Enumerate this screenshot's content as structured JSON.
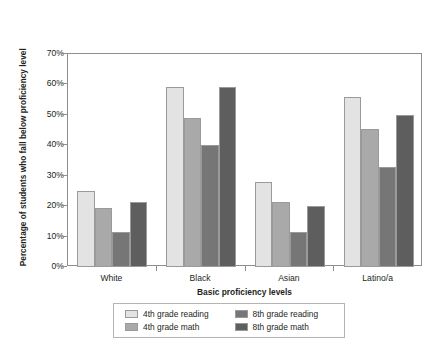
{
  "chart_data": {
    "type": "bar",
    "title": "",
    "xlabel": "Basic proficiency levels",
    "ylabel": "Percentage of students who fall below proficiency level",
    "categories": [
      "White",
      "Black",
      "Asian",
      "Latino/a"
    ],
    "series": [
      {
        "name": "4th grade reading",
        "color": "#e3e3e3",
        "values": [
          25,
          59,
          28,
          56
        ]
      },
      {
        "name": "4th grade math",
        "color": "#a9a9a9",
        "values": [
          19.5,
          49,
          21.5,
          45.5
        ]
      },
      {
        "name": "8th grade reading",
        "color": "#767676",
        "values": [
          11.5,
          40,
          11.5,
          33
        ]
      },
      {
        "name": "8th grade math",
        "color": "#5e5e5e",
        "values": [
          21.5,
          59,
          20,
          50
        ]
      }
    ],
    "ylim": [
      0,
      70
    ],
    "ytick_labels": [
      "0%",
      "10%",
      "20%",
      "30%",
      "40%",
      "50%",
      "60%",
      "70%"
    ],
    "ytick_values": [
      0,
      10,
      20,
      30,
      40,
      50,
      60,
      70
    ],
    "grid": false,
    "legend_position": "bottom-center",
    "axis_color": "#8e8e8e",
    "text_color": "#231f20"
  }
}
